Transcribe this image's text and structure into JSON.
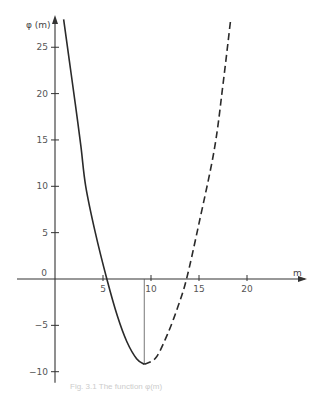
{
  "chart_data": {
    "type": "line",
    "title": "",
    "xlabel": "m",
    "ylabel": "φ (m)",
    "xlim": [
      -4,
      25
    ],
    "ylim": [
      -11,
      28.5
    ],
    "x_ticks": [
      5,
      10,
      15,
      20
    ],
    "y_ticks": [
      -10,
      -5,
      0,
      5,
      10,
      15,
      20,
      25
    ],
    "x_tick_labels": [
      "5",
      "10",
      "15",
      "20"
    ],
    "y_tick_labels": [
      "−10",
      "−5",
      "0",
      "5",
      "10",
      "15",
      "20",
      "25"
    ],
    "origin_label": "0",
    "grid": false,
    "legend": null,
    "annotations": [
      {
        "type": "vertical-line",
        "x": 9.3,
        "from_y": 0,
        "to_y": -9.2,
        "description": "drop line marking minimum"
      }
    ],
    "series": [
      {
        "name": "solid",
        "style": "solid",
        "points": [
          [
            0.9,
            28
          ],
          [
            1.5,
            23.5
          ],
          [
            2.1,
            19
          ],
          [
            2.7,
            14.3
          ],
          [
            3.2,
            10
          ],
          [
            4.2,
            5
          ],
          [
            5.4,
            0
          ],
          [
            6.5,
            -4
          ],
          [
            7.5,
            -6.8
          ],
          [
            8.5,
            -8.6
          ],
          [
            9.3,
            -9.2
          ]
        ]
      },
      {
        "name": "dashed",
        "style": "dashed",
        "points": [
          [
            9.3,
            -9.2
          ],
          [
            10.5,
            -8.5
          ],
          [
            11.7,
            -6
          ],
          [
            12.8,
            -3
          ],
          [
            13.7,
            0
          ],
          [
            15,
            6
          ],
          [
            16.6,
            14
          ],
          [
            17.5,
            21
          ],
          [
            18.3,
            28
          ]
        ]
      }
    ]
  },
  "caption": "Fig. 3.1   The function φ(m)"
}
